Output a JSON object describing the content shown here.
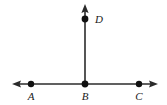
{
  "figure": {
    "type": "geometry-line-diagram",
    "background_color": "#ffffff",
    "stroke_color": "#2b2b2b",
    "dot_color": "#111111",
    "canvas": {
      "width": 167,
      "height": 105
    },
    "lines": [
      {
        "name": "horizontal-line-AC",
        "orientation": "horizontal",
        "x1": 13,
        "y1": 84,
        "x2": 157,
        "y2": 84,
        "arrow_start": true,
        "arrow_end": true,
        "stroke_width": 1.6
      },
      {
        "name": "vertical-ray-BD",
        "orientation": "vertical",
        "x1": 85,
        "y1": 84,
        "x2": 85,
        "y2": 5,
        "arrow_start": false,
        "arrow_end": true,
        "stroke_width": 1.6
      }
    ],
    "points": [
      {
        "id": "A",
        "label": "A",
        "cx": 31,
        "cy": 84,
        "r": 3.2,
        "label_x": 31,
        "label_y": 100
      },
      {
        "id": "B",
        "label": "B",
        "cx": 85,
        "cy": 84,
        "r": 3.4,
        "label_x": 85,
        "label_y": 100
      },
      {
        "id": "C",
        "label": "C",
        "cx": 139,
        "cy": 84,
        "r": 3.2,
        "label_x": 139,
        "label_y": 100
      },
      {
        "id": "D",
        "label": "D",
        "cx": 85,
        "cy": 19,
        "r": 3.4,
        "label_x": 95,
        "label_y": 23
      }
    ]
  }
}
